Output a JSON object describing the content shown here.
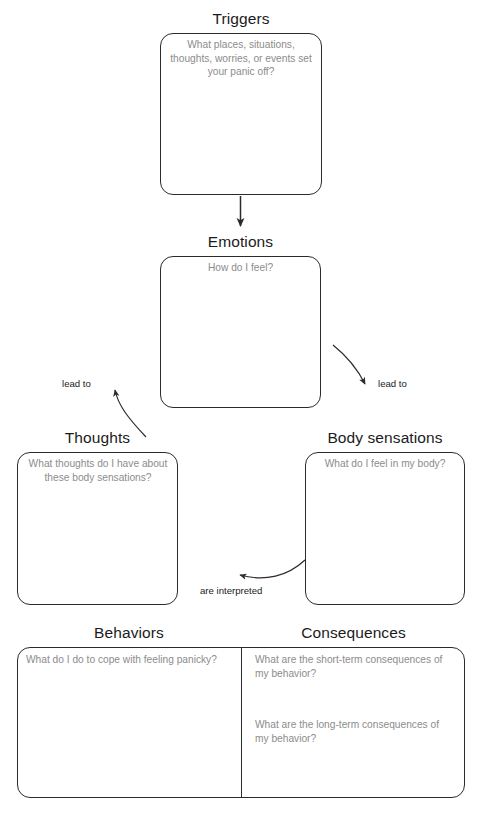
{
  "worksheet": {
    "sections": [
      {
        "key": "triggers",
        "title": "Triggers",
        "placeholder": "What places, situations, thoughts, worries, or events set your panic off?"
      },
      {
        "key": "emotions",
        "title": "Emotions",
        "placeholder": "How do I feel?"
      },
      {
        "key": "thoughts",
        "title": "Thoughts",
        "placeholder": "What thoughts do I have about these body sensations?"
      },
      {
        "key": "body_sensations",
        "title": "Body sensations",
        "placeholder": "What do I feel in my body?"
      },
      {
        "key": "behaviors",
        "title": "Behaviors",
        "placeholder": "What do I do to cope with feeling panicky?"
      },
      {
        "key": "consequences",
        "title": "Consequences",
        "placeholder_short": "What are the short-term consequences of my behavior?",
        "placeholder_long": "What are the long-term consequences of my behavior?"
      }
    ],
    "connectors": [
      {
        "key": "triggers_to_emotions",
        "label": ""
      },
      {
        "key": "emotions_to_thoughts",
        "label": "lead to"
      },
      {
        "key": "emotions_to_body",
        "label": "lead to"
      },
      {
        "key": "body_to_thoughts",
        "label": "are interpreted"
      }
    ],
    "colors": {
      "stroke": "#2b2b2b",
      "heading": "#1b1b1b",
      "placeholder": "#8c8c8c",
      "background": "#ffffff"
    }
  }
}
